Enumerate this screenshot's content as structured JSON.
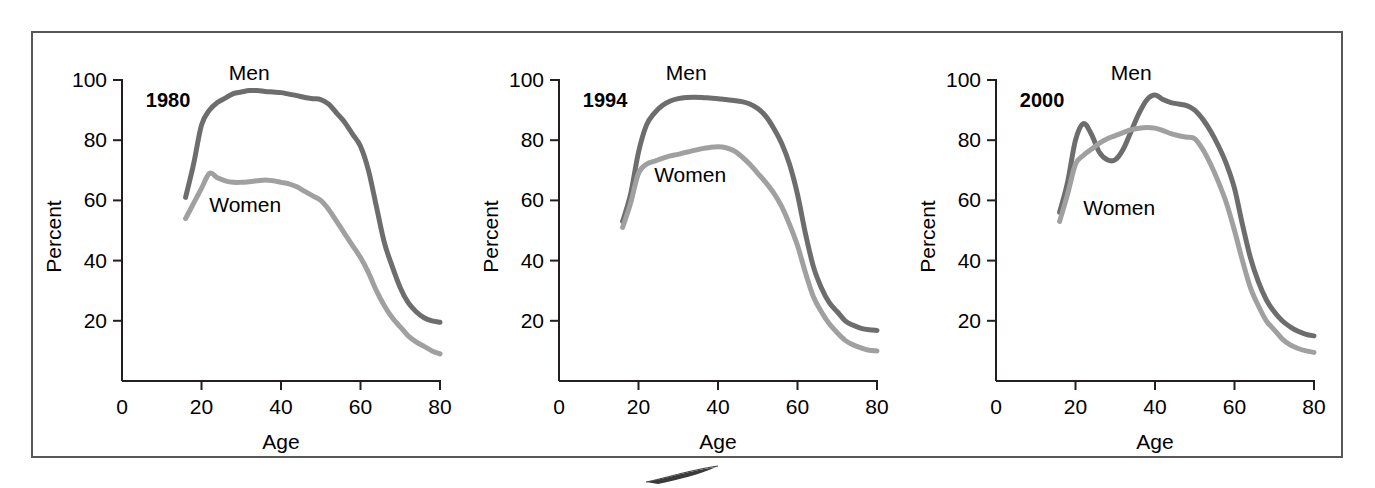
{
  "figure": {
    "border_color": "#58585a",
    "background": "#ffffff",
    "men_color": "#6d6d6d",
    "women_color": "#a0a0a0",
    "axis_color": "#231f20",
    "text_color": "#000000"
  },
  "chart_data": [
    {
      "type": "line",
      "title": "1980",
      "xlabel": "Age",
      "ylabel": "Percent",
      "xlim": [
        0,
        80
      ],
      "ylim": [
        0,
        100
      ],
      "xticks": [
        0,
        20,
        40,
        60,
        80
      ],
      "yticks": [
        20,
        40,
        60,
        80,
        100
      ],
      "xtick_labels": [
        "0",
        "20",
        "40",
        "60",
        "80"
      ],
      "ytick_labels": [
        "20",
        "40",
        "60",
        "80",
        "100"
      ],
      "grid": false,
      "legend": "inline-annotations",
      "annotations": [
        {
          "text": "Men",
          "x": 32,
          "y": 100
        },
        {
          "text": "Women",
          "x": 31,
          "y": 56
        },
        {
          "text": "1980",
          "x": 6,
          "y": 91
        }
      ],
      "x": [
        16,
        18,
        20,
        22,
        24,
        26,
        28,
        30,
        32,
        34,
        36,
        38,
        40,
        42,
        44,
        46,
        48,
        50,
        52,
        54,
        56,
        58,
        60,
        62,
        64,
        66,
        68,
        70,
        72,
        74,
        76,
        78,
        80
      ],
      "series": [
        {
          "name": "Men",
          "color": "#6d6d6d",
          "values": [
            61,
            72,
            85,
            90,
            92.5,
            94,
            95.5,
            96,
            96.5,
            96.5,
            96.2,
            96,
            95.8,
            95.3,
            94.8,
            94.2,
            93.8,
            93.5,
            92,
            89,
            86,
            82,
            78,
            70,
            58,
            46,
            38,
            31,
            26,
            23,
            21,
            20,
            19.5
          ]
        },
        {
          "name": "Women",
          "color": "#a0a0a0",
          "values": [
            54,
            59,
            64,
            69,
            67.5,
            66.5,
            66,
            66,
            66.2,
            66.5,
            66.8,
            66.5,
            66,
            65.5,
            64.5,
            63,
            61.5,
            60,
            57,
            53,
            49,
            45,
            41,
            36,
            30,
            25,
            21,
            18,
            15,
            13,
            11.5,
            10,
            9
          ]
        }
      ]
    },
    {
      "type": "line",
      "title": "1994",
      "xlabel": "Age",
      "ylabel": "Percent",
      "xlim": [
        0,
        80
      ],
      "ylim": [
        0,
        100
      ],
      "xticks": [
        0,
        20,
        40,
        60,
        80
      ],
      "yticks": [
        20,
        40,
        60,
        80,
        100
      ],
      "xtick_labels": [
        "0",
        "20",
        "40",
        "60",
        "80"
      ],
      "ytick_labels": [
        "20",
        "40",
        "60",
        "80",
        "100"
      ],
      "grid": false,
      "legend": "inline-annotations",
      "annotations": [
        {
          "text": "Men",
          "x": 32,
          "y": 100
        },
        {
          "text": "Women",
          "x": 33,
          "y": 66
        },
        {
          "text": "1994",
          "x": 6,
          "y": 91
        }
      ],
      "x": [
        16,
        18,
        20,
        22,
        24,
        26,
        28,
        30,
        32,
        34,
        36,
        38,
        40,
        42,
        44,
        46,
        48,
        50,
        52,
        54,
        56,
        58,
        60,
        62,
        64,
        66,
        68,
        70,
        72,
        74,
        76,
        78,
        80
      ],
      "series": [
        {
          "name": "Men",
          "color": "#6d6d6d",
          "values": [
            53,
            62,
            76,
            85,
            89,
            91.5,
            93,
            93.8,
            94.2,
            94.3,
            94.2,
            94,
            93.8,
            93.5,
            93.2,
            92.8,
            92,
            90.5,
            88,
            84,
            79,
            72,
            62,
            49,
            38,
            31,
            26,
            23,
            20,
            18.5,
            17.5,
            17,
            16.8
          ]
        },
        {
          "name": "Women",
          "color": "#a0a0a0",
          "values": [
            51,
            59,
            69,
            72,
            73,
            74,
            74.8,
            75.3,
            76,
            76.6,
            77.2,
            77.6,
            77.8,
            77.5,
            76.5,
            74.5,
            72,
            69,
            66,
            62.5,
            58,
            52,
            45,
            36,
            28,
            23,
            19,
            16,
            13.5,
            12,
            11,
            10.2,
            10
          ]
        }
      ]
    },
    {
      "type": "line",
      "title": "2000",
      "xlabel": "Age",
      "ylabel": "Percent",
      "xlim": [
        0,
        80
      ],
      "ylim": [
        0,
        100
      ],
      "xticks": [
        0,
        20,
        40,
        60,
        80
      ],
      "yticks": [
        20,
        40,
        60,
        80,
        100
      ],
      "xtick_labels": [
        "0",
        "20",
        "40",
        "60",
        "80"
      ],
      "ytick_labels": [
        "20",
        "40",
        "60",
        "80",
        "100"
      ],
      "grid": false,
      "legend": "inline-annotations",
      "annotations": [
        {
          "text": "Men",
          "x": 34,
          "y": 100
        },
        {
          "text": "Women",
          "x": 31,
          "y": 55
        },
        {
          "text": "2000",
          "x": 6,
          "y": 91
        }
      ],
      "x": [
        16,
        18,
        20,
        22,
        24,
        26,
        28,
        30,
        32,
        34,
        36,
        38,
        40,
        42,
        44,
        46,
        48,
        50,
        52,
        54,
        56,
        58,
        60,
        62,
        64,
        66,
        68,
        70,
        72,
        74,
        76,
        78,
        80
      ],
      "series": [
        {
          "name": "Men",
          "color": "#6d6d6d",
          "values": [
            56,
            66,
            80,
            85.5,
            82,
            76,
            73.5,
            73.5,
            77,
            83,
            89,
            93.5,
            95,
            93.5,
            92.5,
            92,
            91.5,
            90,
            87,
            83,
            78,
            72,
            64,
            52,
            41,
            33,
            27,
            23,
            20,
            18,
            16.5,
            15.5,
            15
          ]
        },
        {
          "name": "Women",
          "color": "#a0a0a0",
          "values": [
            53,
            62,
            72,
            75,
            77,
            79,
            80.5,
            81.5,
            82.5,
            83.5,
            84,
            84.2,
            84,
            83.2,
            82.2,
            81.5,
            81,
            80.5,
            77,
            72,
            66,
            59,
            50,
            40,
            31,
            25,
            20,
            17,
            14,
            12,
            10.8,
            10,
            9.5
          ]
        }
      ]
    }
  ]
}
